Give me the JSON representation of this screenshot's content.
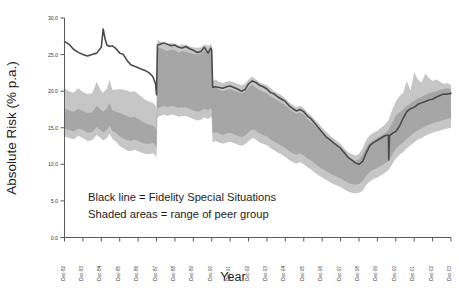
{
  "chart_data": {
    "type": "area",
    "title": "",
    "xlabel": "Year",
    "ylabel": "Absolute Risk (% p.a.)",
    "ylim": [
      0.0,
      30.0
    ],
    "yticks": [
      0.0,
      5.0,
      10.0,
      15.0,
      20.0,
      25.0,
      30.0
    ],
    "ytick_labels": [
      "0.0",
      "5.0",
      "10.0",
      "15.0",
      "20.0",
      "25.0",
      "30.0"
    ],
    "grid": false,
    "legend_position": "inside-lower-left",
    "annotations": [
      "Black line = Fidelity Special Situations",
      "Shaded areas = range of peer group"
    ],
    "categories": [
      "Dec-82",
      "Dec-83",
      "Dec-84",
      "Dec-85",
      "Dec-86",
      "Dec-87",
      "Dec-88",
      "Dec-89",
      "Dec-90",
      "Dec-91",
      "Dec-92",
      "Dec-93",
      "Dec-94",
      "Dec-95",
      "Dec-96",
      "Dec-97",
      "Dec-98",
      "Dec-99",
      "Dec-00",
      "Dec-01",
      "Dec-02",
      "Dec-03"
    ],
    "colors": {
      "line": "#4a4a4a",
      "outer_band": "#c6c6c6",
      "inner_band": "#a6a6a6",
      "axis": "#5a5a5a",
      "text": "#1d1d1d"
    },
    "series": [
      {
        "name": "Fidelity Special Situations",
        "role": "line",
        "x": [
          0.0,
          0.25,
          0.5,
          0.75,
          1.0,
          1.25,
          1.5,
          1.75,
          2.0,
          2.1,
          2.2,
          2.3,
          2.45,
          2.6,
          2.8,
          3.0,
          3.2,
          3.4,
          3.6,
          3.8,
          4.0,
          4.2,
          4.4,
          4.6,
          4.8,
          4.95,
          5.0,
          5.05,
          5.2,
          5.4,
          5.6,
          5.8,
          6.0,
          6.2,
          6.4,
          6.6,
          6.8,
          7.0,
          7.2,
          7.4,
          7.6,
          7.8,
          7.95,
          8.0,
          8.05,
          8.2,
          8.4,
          8.6,
          8.8,
          9.0,
          9.2,
          9.4,
          9.6,
          9.8,
          10.0,
          10.2,
          10.4,
          10.6,
          10.8,
          11.0,
          11.2,
          11.4,
          11.6,
          11.8,
          12.0,
          12.2,
          12.4,
          12.6,
          12.8,
          13.0,
          13.2,
          13.4,
          13.6,
          13.8,
          14.0,
          14.2,
          14.4,
          14.6,
          14.8,
          15.0,
          15.2,
          15.4,
          15.6,
          15.8,
          16.0,
          16.2,
          16.4,
          16.6,
          16.8,
          17.0,
          17.2,
          17.4,
          17.6,
          17.62,
          17.66,
          17.8,
          18.0,
          18.2,
          18.4,
          18.6,
          18.8,
          19.0,
          19.2,
          19.4,
          19.6,
          19.8,
          20.0,
          20.2,
          20.4,
          20.6,
          20.8,
          21.0
        ],
        "y": [
          26.8,
          26.4,
          25.7,
          25.3,
          25.0,
          24.8,
          25.0,
          25.2,
          26.0,
          28.5,
          27.2,
          26.3,
          26.1,
          26.2,
          25.8,
          25.2,
          25.0,
          24.2,
          23.6,
          23.4,
          23.2,
          23.0,
          22.8,
          22.5,
          22.0,
          21.0,
          19.5,
          26.3,
          26.4,
          26.6,
          26.4,
          26.2,
          26.3,
          26.0,
          25.9,
          26.1,
          25.8,
          25.6,
          25.3,
          25.4,
          26.0,
          25.2,
          25.9,
          25.6,
          20.5,
          20.6,
          20.5,
          20.4,
          20.6,
          20.7,
          20.5,
          20.3,
          20.0,
          20.2,
          21.0,
          21.4,
          21.2,
          20.8,
          20.6,
          20.3,
          19.8,
          19.6,
          19.2,
          18.9,
          18.6,
          18.0,
          17.6,
          17.3,
          17.5,
          17.2,
          16.6,
          16.2,
          15.6,
          15.0,
          14.4,
          13.8,
          13.4,
          13.0,
          12.6,
          12.2,
          11.6,
          11.0,
          10.6,
          10.2,
          10.0,
          10.4,
          11.6,
          12.6,
          13.0,
          13.3,
          13.6,
          13.9,
          14.0,
          10.6,
          13.9,
          14.2,
          14.5,
          15.2,
          16.3,
          17.2,
          17.6,
          17.8,
          18.2,
          18.4,
          18.6,
          18.8,
          18.9,
          19.2,
          19.4,
          19.6,
          19.6,
          19.7
        ]
      },
      {
        "name": "Peer group full range",
        "role": "outer_band",
        "x": [
          0.0,
          0.25,
          0.5,
          0.75,
          1.0,
          1.25,
          1.5,
          1.75,
          2.0,
          2.1,
          2.2,
          2.3,
          2.45,
          2.6,
          2.8,
          3.0,
          3.2,
          3.4,
          3.6,
          3.8,
          4.0,
          4.2,
          4.4,
          4.6,
          4.8,
          4.95,
          5.0,
          5.05,
          5.2,
          5.4,
          5.6,
          5.8,
          6.0,
          6.2,
          6.4,
          6.6,
          6.8,
          7.0,
          7.2,
          7.4,
          7.6,
          7.8,
          7.95,
          8.0,
          8.05,
          8.2,
          8.4,
          8.6,
          8.8,
          9.0,
          9.2,
          9.4,
          9.6,
          9.8,
          10.0,
          10.2,
          10.4,
          10.6,
          10.8,
          11.0,
          11.2,
          11.4,
          11.6,
          11.8,
          12.0,
          12.2,
          12.4,
          12.6,
          12.8,
          13.0,
          13.2,
          13.4,
          13.6,
          13.8,
          14.0,
          14.2,
          14.4,
          14.6,
          14.8,
          15.0,
          15.2,
          15.4,
          15.6,
          15.8,
          16.0,
          16.2,
          16.4,
          16.6,
          16.8,
          17.0,
          17.2,
          17.4,
          17.6,
          17.8,
          18.0,
          18.2,
          18.4,
          18.6,
          18.8,
          19.0,
          19.2,
          19.4,
          19.6,
          19.8,
          20.0,
          20.2,
          20.4,
          20.6,
          20.8,
          21.0
        ],
        "upper": [
          20.4,
          20.0,
          19.8,
          20.4,
          19.9,
          19.6,
          19.7,
          21.3,
          20.0,
          19.8,
          20.1,
          20.3,
          21.6,
          20.2,
          20.2,
          20.3,
          20.2,
          20.1,
          19.9,
          20.0,
          19.6,
          19.2,
          18.8,
          18.6,
          18.4,
          18.0,
          17.2,
          27.0,
          26.8,
          26.6,
          26.4,
          26.6,
          26.5,
          26.2,
          26.4,
          26.3,
          26.1,
          26.0,
          25.9,
          26.0,
          26.4,
          26.2,
          26.4,
          26.2,
          21.4,
          21.6,
          21.3,
          21.1,
          21.3,
          21.4,
          21.2,
          21.0,
          20.8,
          21.0,
          21.6,
          22.0,
          21.6,
          21.2,
          21.0,
          20.8,
          20.4,
          20.0,
          19.7,
          19.4,
          19.0,
          18.5,
          18.1,
          17.8,
          18.0,
          17.7,
          17.1,
          16.7,
          16.1,
          15.6,
          15.0,
          14.5,
          14.0,
          13.6,
          13.2,
          12.8,
          12.2,
          11.7,
          11.4,
          11.2,
          11.4,
          12.2,
          13.4,
          14.0,
          14.3,
          14.6,
          15.0,
          15.4,
          16.0,
          17.4,
          18.6,
          19.3,
          19.8,
          21.4,
          20.1,
          22.6,
          21.6,
          21.2,
          22.4,
          21.8,
          21.4,
          21.6,
          21.3,
          21.0,
          21.1,
          20.8
        ],
        "lower": [
          13.8,
          13.6,
          13.4,
          13.9,
          13.6,
          13.2,
          13.3,
          14.0,
          13.5,
          13.3,
          13.4,
          13.6,
          14.2,
          13.5,
          13.1,
          12.5,
          12.2,
          11.9,
          11.8,
          12.0,
          11.8,
          11.6,
          11.4,
          11.4,
          11.5,
          11.2,
          10.8,
          16.4,
          16.6,
          16.8,
          16.6,
          16.8,
          16.7,
          16.5,
          16.6,
          16.6,
          16.4,
          16.2,
          16.0,
          16.1,
          16.4,
          16.2,
          16.5,
          16.2,
          13.0,
          13.2,
          13.0,
          12.8,
          13.0,
          13.1,
          12.9,
          12.7,
          12.5,
          12.7,
          13.2,
          13.6,
          13.4,
          13.0,
          12.8,
          12.6,
          12.2,
          11.9,
          11.6,
          11.3,
          11.0,
          10.6,
          10.3,
          10.1,
          10.3,
          10.0,
          9.6,
          9.3,
          8.9,
          8.5,
          8.2,
          7.9,
          7.6,
          7.3,
          7.1,
          6.9,
          6.6,
          6.3,
          6.1,
          6.0,
          6.1,
          6.4,
          7.2,
          7.7,
          8.0,
          8.2,
          8.5,
          8.8,
          9.2,
          10.0,
          10.8,
          11.3,
          11.7,
          12.2,
          12.6,
          13.0,
          13.4,
          13.6,
          13.9,
          14.1,
          14.3,
          14.5,
          14.6,
          14.8,
          14.9,
          15.0
        ]
      },
      {
        "name": "Peer group inter-quartile range",
        "role": "inner_band",
        "x": [
          0.0,
          0.25,
          0.5,
          0.75,
          1.0,
          1.25,
          1.5,
          1.75,
          2.0,
          2.1,
          2.2,
          2.3,
          2.45,
          2.6,
          2.8,
          3.0,
          3.2,
          3.4,
          3.6,
          3.8,
          4.0,
          4.2,
          4.4,
          4.6,
          4.8,
          4.95,
          5.0,
          5.05,
          5.2,
          5.4,
          5.6,
          5.8,
          6.0,
          6.2,
          6.4,
          6.6,
          6.8,
          7.0,
          7.2,
          7.4,
          7.6,
          7.8,
          7.95,
          8.0,
          8.05,
          8.2,
          8.4,
          8.6,
          8.8,
          9.0,
          9.2,
          9.4,
          9.6,
          9.8,
          10.0,
          10.2,
          10.4,
          10.6,
          10.8,
          11.0,
          11.2,
          11.4,
          11.6,
          11.8,
          12.0,
          12.2,
          12.4,
          12.6,
          12.8,
          13.0,
          13.2,
          13.4,
          13.6,
          13.8,
          14.0,
          14.2,
          14.4,
          14.6,
          14.8,
          15.0,
          15.2,
          15.4,
          15.6,
          15.8,
          16.0,
          16.2,
          16.4,
          16.6,
          16.8,
          17.0,
          17.2,
          17.4,
          17.6,
          17.8,
          18.0,
          18.2,
          18.4,
          18.6,
          18.8,
          19.0,
          19.2,
          19.4,
          19.6,
          19.8,
          20.0,
          20.2,
          20.4,
          20.6,
          20.8,
          21.0
        ],
        "upper": [
          17.6,
          17.4,
          17.2,
          17.6,
          17.3,
          17.0,
          17.1,
          18.0,
          17.4,
          17.2,
          17.4,
          17.6,
          18.4,
          17.4,
          17.2,
          17.0,
          16.8,
          16.6,
          16.4,
          16.5,
          16.2,
          15.9,
          15.6,
          15.4,
          15.3,
          15.0,
          14.4,
          26.0,
          25.9,
          25.7,
          25.5,
          25.7,
          25.6,
          25.3,
          25.5,
          25.4,
          25.2,
          25.1,
          25.0,
          25.1,
          25.5,
          25.3,
          25.5,
          25.3,
          20.3,
          20.5,
          20.2,
          20.0,
          20.2,
          20.3,
          20.1,
          19.9,
          19.7,
          19.9,
          20.5,
          20.9,
          20.5,
          20.1,
          19.9,
          19.7,
          19.3,
          19.0,
          18.7,
          18.4,
          18.0,
          17.6,
          17.2,
          16.9,
          17.1,
          16.8,
          16.2,
          15.8,
          15.3,
          14.8,
          14.2,
          13.7,
          13.3,
          12.9,
          12.5,
          12.1,
          11.5,
          11.0,
          10.7,
          10.5,
          10.7,
          11.3,
          12.4,
          13.0,
          13.3,
          13.6,
          13.9,
          14.2,
          14.7,
          15.6,
          16.6,
          17.1,
          17.5,
          18.0,
          18.3,
          18.7,
          19.0,
          19.2,
          19.5,
          19.7,
          19.9,
          20.0,
          20.2,
          20.3,
          20.4,
          20.3
        ],
        "lower": [
          14.9,
          14.7,
          14.5,
          14.9,
          14.7,
          14.3,
          14.4,
          15.1,
          14.6,
          14.4,
          14.5,
          14.7,
          15.3,
          14.6,
          14.3,
          13.8,
          13.5,
          13.3,
          13.2,
          13.4,
          13.2,
          13.0,
          12.8,
          12.8,
          12.9,
          12.6,
          12.1,
          17.6,
          17.8,
          18.0,
          17.8,
          18.0,
          17.9,
          17.7,
          17.8,
          17.8,
          17.6,
          17.4,
          17.2,
          17.3,
          17.6,
          17.4,
          17.7,
          17.4,
          14.2,
          14.4,
          14.2,
          14.0,
          14.2,
          14.3,
          14.1,
          13.9,
          13.7,
          13.9,
          14.4,
          14.8,
          14.6,
          14.2,
          14.0,
          13.8,
          13.4,
          13.1,
          12.8,
          12.5,
          12.2,
          11.8,
          11.5,
          11.3,
          11.5,
          11.2,
          10.8,
          10.5,
          10.1,
          9.7,
          9.4,
          9.1,
          8.8,
          8.5,
          8.3,
          8.1,
          7.8,
          7.5,
          7.3,
          7.2,
          7.3,
          7.7,
          8.5,
          9.0,
          9.3,
          9.5,
          9.8,
          10.1,
          10.5,
          11.3,
          12.1,
          12.6,
          13.0,
          13.5,
          13.9,
          14.3,
          14.7,
          14.9,
          15.2,
          15.4,
          15.6,
          15.8,
          15.9,
          16.1,
          16.2,
          16.3
        ]
      }
    ]
  }
}
